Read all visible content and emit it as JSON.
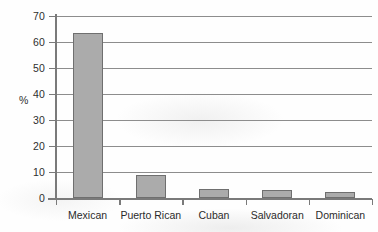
{
  "chart_data": {
    "type": "bar",
    "title": "",
    "subtitle": "",
    "xlabel": "",
    "ylabel": "%",
    "categories": [
      "Mexican",
      "Puerto Rican",
      "Cuban",
      "Salvadoran",
      "Dominican"
    ],
    "values": [
      63.5,
      9,
      3.3,
      3.1,
      2.5
    ],
    "ylim": [
      0,
      70
    ],
    "ytick_step": 10,
    "yticks": [
      0,
      10,
      20,
      30,
      40,
      50,
      60,
      70
    ],
    "ytick_labels": [
      "0",
      "10",
      "20",
      "30",
      "40",
      "50",
      "60",
      "70"
    ],
    "grid": "horizontal",
    "legend": "none",
    "annotations": [],
    "colors": {
      "bar_fill": "#ababab",
      "bar_border": "#6f6f6f",
      "gridline": "#8d8d8d",
      "axis": "#7a7a7a",
      "text": "#2b2b2b",
      "background": "#fefefe"
    }
  }
}
